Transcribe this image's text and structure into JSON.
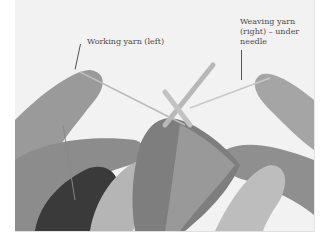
{
  "figure": {
    "labels": {
      "left": "Working yarn (left)",
      "right_line1": "Weaving yarn",
      "right_line2": "(right) – under",
      "right_line3": "needle"
    }
  }
}
